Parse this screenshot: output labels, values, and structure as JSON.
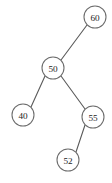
{
  "figure": {
    "background_color": "#ffffff",
    "node_stroke_color": "#6b6b6b",
    "node_fill_color": "#ffffff",
    "edge_color": "#5a5a5a",
    "label_color": "#1c1c1c"
  },
  "chart_data": {
    "type": "diagram",
    "title": "",
    "nodes": [
      {
        "id": "n60",
        "label": "60",
        "cx": 95,
        "cy": 17,
        "r": 11
      },
      {
        "id": "n50",
        "label": "50",
        "cx": 53,
        "cy": 68,
        "r": 11
      },
      {
        "id": "n40",
        "label": "40",
        "cx": 23,
        "cy": 115,
        "r": 11
      },
      {
        "id": "n55",
        "label": "55",
        "cx": 93,
        "cy": 117,
        "r": 11
      },
      {
        "id": "n52",
        "label": "52",
        "cx": 68,
        "cy": 160,
        "r": 11
      }
    ],
    "edges": [
      {
        "id": "e60-50",
        "from": "n60",
        "to": "n50",
        "x1": 87,
        "y1": 25,
        "x2": 61,
        "y2": 60
      },
      {
        "id": "e50-40",
        "from": "n50",
        "to": "n40",
        "x1": 45,
        "y1": 76,
        "x2": 31,
        "y2": 107
      },
      {
        "id": "e50-55",
        "from": "n50",
        "to": "n55",
        "x1": 61,
        "y1": 76,
        "x2": 85,
        "y2": 109
      },
      {
        "id": "e55-52",
        "from": "n55",
        "to": "n52",
        "x1": 85,
        "y1": 125,
        "x2": 76,
        "y2": 152
      }
    ]
  }
}
